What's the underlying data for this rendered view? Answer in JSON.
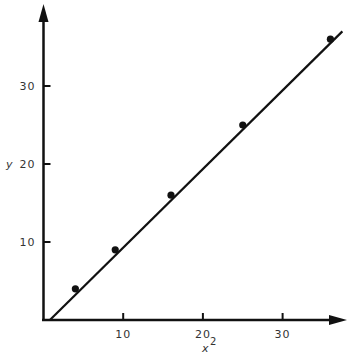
{
  "chart_data": {
    "type": "line",
    "title": "",
    "xlabel": "x",
    "xlabel_superscript": "2",
    "ylabel": "y",
    "xlim": [
      0,
      38
    ],
    "ylim": [
      0,
      39
    ],
    "x_ticks": [
      10,
      20,
      30
    ],
    "y_ticks": [
      10,
      20,
      30
    ],
    "x_tick_labels": [
      "10",
      "20",
      "30"
    ],
    "y_tick_labels": [
      "10",
      "20",
      "30"
    ],
    "grid": false,
    "legend": null,
    "series": [
      {
        "name": "y vs x^2",
        "marker": "circle",
        "line": "straight fit through points",
        "x": [
          4,
          9,
          16,
          25,
          36
        ],
        "y": [
          4,
          9,
          16,
          25,
          36
        ]
      }
    ],
    "fit_line": {
      "from": [
        0.8,
        0
      ],
      "to": [
        37.5,
        37
      ]
    },
    "colors": {
      "line": "#111111",
      "axis": "#111111",
      "text": "#333333",
      "background": "#ffffff"
    }
  }
}
